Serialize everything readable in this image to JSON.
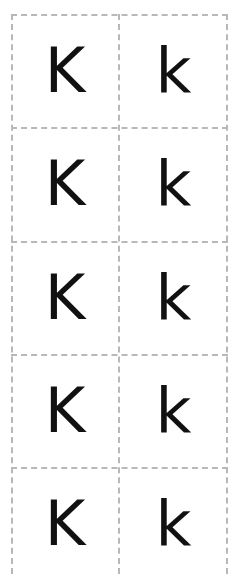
{
  "worksheet": {
    "rows": [
      {
        "upper": "K",
        "lower": "k"
      },
      {
        "upper": "K",
        "lower": "k"
      },
      {
        "upper": "K",
        "lower": "k"
      },
      {
        "upper": "K",
        "lower": "k"
      },
      {
        "upper": "K",
        "lower": "k"
      }
    ],
    "colors": {
      "letter": "#111111",
      "grid_line": "#b8b8b8",
      "background": "#ffffff"
    }
  }
}
